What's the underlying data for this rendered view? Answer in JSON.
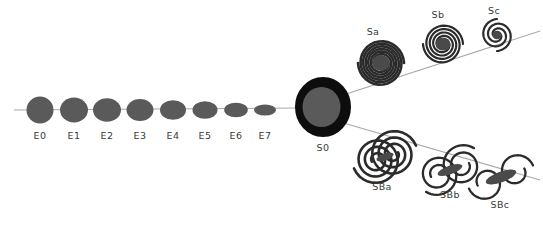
{
  "figure": {
    "name": "hubble-tuning-fork-diagram",
    "background_color": "#ffffff",
    "line_color": "#a8a8a8",
    "ellipse_fill": "#5a5a5a",
    "bulge_fill": "#4a4a4a",
    "arm_color": "#2b2b2b",
    "ring_color": "#0d0d0d",
    "label_color": "#3a3a3a"
  },
  "branches": {
    "elliptical": {
      "name": "elliptical-sequence",
      "items": [
        {
          "label": "E0",
          "cx": 40,
          "cy": 110,
          "rx": 13.5,
          "ry": 13.5,
          "label_x": 40,
          "label_y": 139
        },
        {
          "label": "E1",
          "cx": 74,
          "cy": 110,
          "rx": 14.0,
          "ry": 12.5,
          "label_x": 74,
          "label_y": 139
        },
        {
          "label": "E2",
          "cx": 107,
          "cy": 110,
          "rx": 14.0,
          "ry": 11.8,
          "label_x": 107,
          "label_y": 139
        },
        {
          "label": "E3",
          "cx": 140,
          "cy": 110,
          "rx": 13.5,
          "ry": 11.0,
          "label_x": 140,
          "label_y": 139
        },
        {
          "label": "E4",
          "cx": 173,
          "cy": 110,
          "rx": 13.0,
          "ry": 9.8,
          "label_x": 173,
          "label_y": 139
        },
        {
          "label": "E5",
          "cx": 205,
          "cy": 110,
          "rx": 12.5,
          "ry": 8.8,
          "label_x": 205,
          "label_y": 139
        },
        {
          "label": "E6",
          "cx": 236,
          "cy": 110,
          "rx": 11.8,
          "ry": 7.3,
          "label_x": 236,
          "label_y": 139
        },
        {
          "label": "E7",
          "cx": 265,
          "cy": 110,
          "rx": 11.0,
          "ry": 5.6,
          "label_x": 265,
          "label_y": 139
        }
      ]
    },
    "lenticular": {
      "name": "lenticular-hinge",
      "item": {
        "label": "S0",
        "cx": 323,
        "cy": 107,
        "rx": 22,
        "ry": 24,
        "label_x": 323,
        "label_y": 151
      }
    },
    "normal_spiral": {
      "name": "normal-spiral-sequence",
      "items": [
        {
          "label": "Sa",
          "cx": 381,
          "cy": 63,
          "r": 23,
          "turns": 3.0,
          "bulge": 9.0,
          "label_x": 373,
          "label_y": 35
        },
        {
          "label": "Sb",
          "cx": 443,
          "cy": 44,
          "r": 20,
          "turns": 2.0,
          "bulge": 7.5,
          "label_x": 438,
          "label_y": 18
        },
        {
          "label": "Sc",
          "cx": 497,
          "cy": 35,
          "r": 16,
          "turns": 1.25,
          "bulge": 4.8,
          "label_x": 494,
          "label_y": 14
        }
      ]
    },
    "barred_spiral": {
      "name": "barred-spiral-sequence",
      "items": [
        {
          "label": "SBa",
          "cx": 385,
          "cy": 157,
          "r": 24,
          "turns": 3.0,
          "bar": 9,
          "label_x": 382,
          "label_y": 190
        },
        {
          "label": "SBb",
          "cx": 450,
          "cy": 170,
          "r": 21,
          "turns": 1.9,
          "bar": 13,
          "label_x": 450,
          "label_y": 198
        },
        {
          "label": "SBc",
          "cx": 501,
          "cy": 177,
          "r": 18,
          "turns": 1.0,
          "bar": 16,
          "label_x": 500,
          "label_y": 208
        }
      ]
    }
  },
  "connectors": {
    "name": "connector-lines",
    "trunk": {
      "x1": 14,
      "y1": 110,
      "x2": 300,
      "y2": 108
    },
    "upper_fork": {
      "x1": 340,
      "y1": 96,
      "x2": 540,
      "y2": 31
    },
    "lower_fork": {
      "x1": 340,
      "y1": 122,
      "x2": 540,
      "y2": 180
    }
  }
}
